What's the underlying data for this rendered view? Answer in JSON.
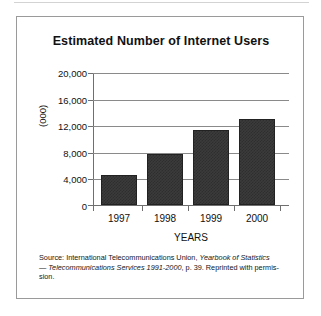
{
  "figure": {
    "title": "Estimated Number of Internet Users",
    "source_line_1_plain": "Source: International Telecommunications Union,",
    "source_line_1_italic": "Yearbook of Statistics",
    "source_line_2_dash": "— ",
    "source_line_2_italic": "Telecommunications Services 1991-2000",
    "source_line_2_plain": ", p. 39. Reprinted with permis-",
    "source_line_3_plain": "sion."
  },
  "chart_data": {
    "type": "bar",
    "title": "Estimated Number of Internet Users",
    "categories": [
      "1997",
      "1998",
      "1999",
      "2000"
    ],
    "values": [
      4500,
      7700,
      11300,
      13000
    ],
    "xlabel": "YEARS",
    "ylabel": "(000)",
    "ylim": [
      0,
      20000
    ],
    "yticks": [
      0,
      4000,
      8000,
      12000,
      16000,
      20000
    ],
    "ytick_labels": [
      "0",
      "4,000",
      "8,000",
      "12,000",
      "16,000",
      "20,000"
    ],
    "grid": true,
    "legend": false,
    "bar_color": "#3b3b3b",
    "axis_color": "#6f6f6f",
    "gridline_color": "#8a8a8a"
  }
}
